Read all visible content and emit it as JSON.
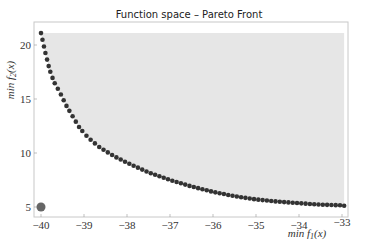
{
  "chart_data": {
    "type": "scatter",
    "title": "Function space  – Pareto Front",
    "xlabel": "min f1(x)",
    "ylabel": "min f2(x)",
    "xlim": [
      -40.1,
      -32.85
    ],
    "ylim": [
      4.1,
      22.1
    ],
    "x_ticks": [
      -40,
      -39,
      -38,
      -37,
      -36,
      -35,
      -34,
      -33
    ],
    "y_ticks": [
      5,
      10,
      15,
      20
    ],
    "grid": false,
    "legend": null,
    "feasible_region": {
      "color": "#e6e6e6",
      "description": "shaded region above/right of the Pareto front",
      "x_range": [
        -40,
        -32.95
      ],
      "y_top": 21.1
    },
    "series": [
      {
        "name": "Pareto front",
        "color": "#333333",
        "marker": "circle",
        "points": [
          [
            -40.0,
            21.1
          ],
          [
            -39.9,
            19.3
          ],
          [
            -39.8,
            17.7
          ],
          [
            -39.7,
            16.6
          ],
          [
            -39.56,
            15.6
          ],
          [
            -39.4,
            14.3
          ],
          [
            -39.25,
            13.3
          ],
          [
            -39.1,
            12.3
          ],
          [
            -38.9,
            11.4
          ],
          [
            -38.63,
            10.5
          ],
          [
            -38.3,
            9.7
          ],
          [
            -38.0,
            9.1
          ],
          [
            -37.5,
            8.2
          ],
          [
            -37.0,
            7.5
          ],
          [
            -36.5,
            6.9
          ],
          [
            -36.0,
            6.4
          ],
          [
            -35.5,
            6.0
          ],
          [
            -35.0,
            5.7
          ],
          [
            -34.5,
            5.5
          ],
          [
            -34.0,
            5.35
          ],
          [
            -33.5,
            5.22
          ],
          [
            -33.0,
            5.15
          ],
          [
            -32.95,
            5.12
          ]
        ]
      },
      {
        "name": "Ideal point",
        "color": "#666666",
        "marker": "circle",
        "points": [
          [
            -40.0,
            5.0
          ]
        ]
      }
    ]
  }
}
